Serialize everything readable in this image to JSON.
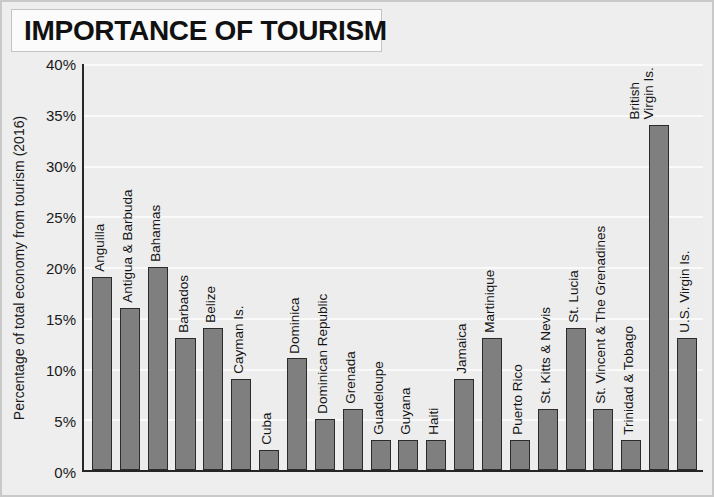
{
  "title": "IMPORTANCE OF TOURISM",
  "axis": {
    "ylabel": "Percentage of total economy from tourism (2016)"
  },
  "chart_data": {
    "type": "bar",
    "title": "IMPORTANCE OF TOURISM",
    "xlabel": "",
    "ylabel": "Percentage of total economy from tourism (2016)",
    "ylim": [
      0,
      40
    ],
    "ytick_labels": [
      "0%",
      "5%",
      "10%",
      "15%",
      "20%",
      "25%",
      "30%",
      "35%",
      "40%"
    ],
    "ytick_values": [
      0,
      5,
      10,
      15,
      20,
      25,
      30,
      35,
      40
    ],
    "grid": true,
    "legend": "none",
    "bar_color": "#7f7f7f",
    "categories": [
      "Anguilla",
      "Antigua & Barbuda",
      "Bahamas",
      "Barbados",
      "Belize",
      "Cayman Is.",
      "Cuba",
      "Dominica",
      "Dominican Republic",
      "Grenada",
      "Guadeloupe",
      "Guyana",
      "Haiti",
      "Jamaica",
      "Martinique",
      "Puerto Rico",
      "St. Kitts & Nevis",
      "St. Lucia",
      "St. Vincent & The Grenadines",
      "Trinidad & Tobago",
      "British Virgin Is.",
      "U.S. Virgin Is."
    ],
    "values": [
      19,
      16,
      20,
      13,
      14,
      9,
      2,
      11,
      5,
      6,
      3,
      3,
      3,
      9,
      13,
      3,
      6,
      14,
      6,
      3,
      34,
      13
    ]
  }
}
